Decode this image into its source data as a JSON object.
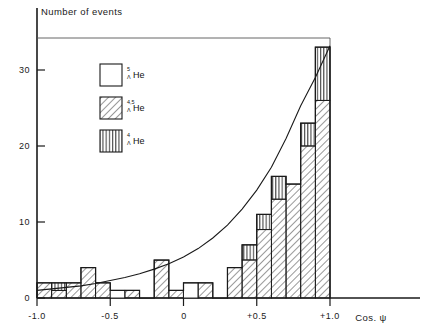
{
  "chart_data": {
    "type": "bar",
    "title": "",
    "ylabel": "Number of events",
    "xlabel": "Cos. ψ",
    "xlim": [
      -1.0,
      1.0
    ],
    "ylim": [
      0,
      35
    ],
    "grid": false,
    "bin_width": 0.1,
    "categories": [
      "-1.0..-0.9",
      "-0.9..-0.8",
      "-0.8..-0.7",
      "-0.7..-0.6",
      "-0.6..-0.5",
      "-0.5..-0.4",
      "-0.4..-0.3",
      "-0.3..-0.2",
      "-0.2..-0.1",
      "-0.1..0.0",
      "0.0..0.1",
      "0.1..0.2",
      "0.2..0.3",
      "0.3..0.4",
      "0.4..0.5",
      "0.5..0.6",
      "0.6..0.7",
      "0.7..0.8",
      "0.8..0.9",
      "0.9..1.0"
    ],
    "bin_edges": [
      -1.0,
      -0.9,
      -0.8,
      -0.7,
      -0.6,
      -0.5,
      -0.4,
      -0.3,
      -0.2,
      -0.1,
      0.0,
      0.1,
      0.2,
      0.3,
      0.4,
      0.5,
      0.6,
      0.7,
      0.8,
      0.9,
      1.0
    ],
    "series": [
      {
        "name": "5_LHe",
        "style": "open",
        "values": [
          0,
          0,
          0,
          0,
          0,
          1,
          0,
          0,
          0,
          0,
          2,
          0,
          0,
          0,
          0,
          0,
          0,
          0,
          0,
          0
        ]
      },
      {
        "name": "4,5_LHe",
        "style": "diagonal-hatch",
        "values": [
          2,
          1,
          2,
          4,
          2,
          0,
          1,
          0,
          5,
          1,
          0,
          2,
          0,
          4,
          5,
          9,
          13,
          15,
          20,
          26
        ]
      },
      {
        "name": "4_LHe",
        "style": "vertical-hatch",
        "values": [
          0,
          1,
          0,
          0,
          0,
          0,
          0,
          0,
          0,
          0,
          0,
          0,
          0,
          0,
          2,
          2,
          3,
          0,
          3,
          7
        ]
      }
    ],
    "totals": [
      2,
      2,
      2,
      4,
      2,
      1,
      1,
      0,
      5,
      1,
      2,
      2,
      0,
      4,
      7,
      11,
      16,
      15,
      23,
      33
    ],
    "curve": {
      "name": "fitted distribution",
      "x": [
        -1.0,
        -0.9,
        -0.8,
        -0.7,
        -0.6,
        -0.5,
        -0.4,
        -0.3,
        -0.2,
        -0.1,
        0.0,
        0.1,
        0.2,
        0.3,
        0.4,
        0.5,
        0.6,
        0.7,
        0.8,
        0.9,
        1.0
      ],
      "y": [
        1.0,
        1.2,
        1.4,
        1.6,
        1.9,
        2.3,
        2.7,
        3.2,
        3.8,
        4.5,
        5.4,
        6.5,
        7.9,
        9.6,
        11.7,
        14.2,
        17.2,
        21.0,
        25.3,
        29.0,
        33.2
      ]
    },
    "xticks": [
      -1.0,
      -0.5,
      0.0,
      0.5,
      1.0
    ],
    "xtick_labels": [
      "-1.0",
      "-0.5",
      "0",
      "+0.5",
      "+1.0"
    ],
    "yticks": [
      0,
      10,
      20,
      30
    ],
    "ytick_labels": [
      "0",
      "10",
      "20",
      "30"
    ]
  },
  "legend": {
    "position": "upper-left-inset",
    "entries": [
      {
        "swatch": "open",
        "superscript": "5",
        "subscript": "Λ",
        "element": "He"
      },
      {
        "swatch": "diagonal-hatch",
        "superscript": "4,5",
        "subscript": "Λ",
        "element": "He"
      },
      {
        "swatch": "vertical-hatch",
        "superscript": "4",
        "subscript": "Λ",
        "element": "He"
      }
    ]
  },
  "colors": {
    "ink": "#1a1a1a",
    "background": "#ffffff",
    "hatch": "#333333"
  }
}
